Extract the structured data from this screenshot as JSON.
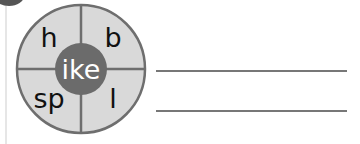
{
  "exercise": {
    "wheel": {
      "center_word_ending": "ike",
      "onsets": [
        "h",
        "b",
        "sp",
        "l"
      ],
      "colors": {
        "segment_fill": "#d9d9d9",
        "outline": "#6e6e6e",
        "center_fill": "#6b6b6b",
        "center_text": "#ffffff",
        "onset_text": "#111111"
      }
    },
    "answer_lines": [
      {
        "value": ""
      },
      {
        "value": ""
      }
    ]
  }
}
